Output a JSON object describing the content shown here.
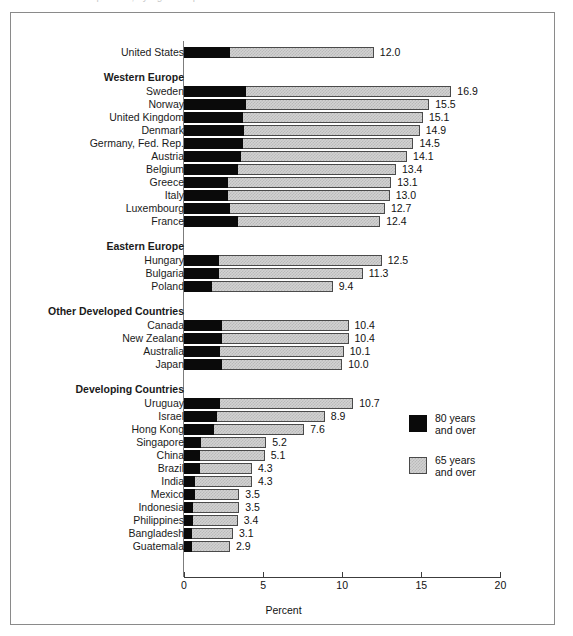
{
  "scan": {
    "top_ghost_text": "Percent of Population, by Age Group"
  },
  "chart_data": {
    "type": "bar",
    "orientation": "horizontal",
    "stacked": true,
    "title": "",
    "xlabel": "Percent",
    "ylabel": "",
    "xlim": [
      0,
      20
    ],
    "xticks": [
      0,
      5,
      10,
      15,
      20
    ],
    "xtick_labels": [
      "0",
      "5",
      "10",
      "15",
      "20"
    ],
    "grid": false,
    "legend_position": "right-inside",
    "series": [
      {
        "name": "80 years and over",
        "key": "v80",
        "color": "#0a0a0a"
      },
      {
        "name": "65 years and over",
        "key": "v65",
        "color": "#d2d2d2"
      }
    ],
    "legend": [
      {
        "line1": "80 years",
        "line2": "and over",
        "swatch": "dark"
      },
      {
        "line1": "65 years",
        "line2": "and over",
        "swatch": "light"
      }
    ],
    "rows": [
      {
        "type": "bar",
        "label": "United States",
        "v65": 12.0,
        "v80": 2.9,
        "value_label": "12.0"
      },
      {
        "type": "spacer"
      },
      {
        "type": "group",
        "label": "Western Europe"
      },
      {
        "type": "bar",
        "label": "Sweden",
        "v65": 16.9,
        "v80": 3.9,
        "value_label": "16.9"
      },
      {
        "type": "bar",
        "label": "Norway",
        "v65": 15.5,
        "v80": 3.9,
        "value_label": "15.5"
      },
      {
        "type": "bar",
        "label": "United Kingdom",
        "v65": 15.1,
        "v80": 3.7,
        "value_label": "15.1"
      },
      {
        "type": "bar",
        "label": "Denmark",
        "v65": 14.9,
        "v80": 3.8,
        "value_label": "14.9"
      },
      {
        "type": "bar",
        "label": "Germany, Fed. Rep.",
        "v65": 14.5,
        "v80": 3.7,
        "value_label": "14.5"
      },
      {
        "type": "bar",
        "label": "Austria",
        "v65": 14.1,
        "v80": 3.6,
        "value_label": "14.1"
      },
      {
        "type": "bar",
        "label": "Belgium",
        "v65": 13.4,
        "v80": 3.4,
        "value_label": "13.4"
      },
      {
        "type": "bar",
        "label": "Greece",
        "v65": 13.1,
        "v80": 2.8,
        "value_label": "13.1"
      },
      {
        "type": "bar",
        "label": "Italy",
        "v65": 13.0,
        "v80": 2.8,
        "value_label": "13.0"
      },
      {
        "type": "bar",
        "label": "Luxembourg",
        "v65": 12.7,
        "v80": 2.9,
        "value_label": "12.7"
      },
      {
        "type": "bar",
        "label": "France",
        "v65": 12.4,
        "v80": 3.4,
        "value_label": "12.4"
      },
      {
        "type": "spacer"
      },
      {
        "type": "group",
        "label": "Eastern Europe"
      },
      {
        "type": "bar",
        "label": "Hungary",
        "v65": 12.5,
        "v80": 2.2,
        "value_label": "12.5"
      },
      {
        "type": "bar",
        "label": "Bulgaria",
        "v65": 11.3,
        "v80": 2.2,
        "value_label": "11.3"
      },
      {
        "type": "bar",
        "label": "Poland",
        "v65": 9.4,
        "v80": 1.8,
        "value_label": "9.4"
      },
      {
        "type": "spacer"
      },
      {
        "type": "group",
        "label": "Other Developed Countries"
      },
      {
        "type": "bar",
        "label": "Canada",
        "v65": 10.4,
        "v80": 2.4,
        "value_label": "10.4"
      },
      {
        "type": "bar",
        "label": "New Zealand",
        "v65": 10.4,
        "v80": 2.4,
        "value_label": "10.4"
      },
      {
        "type": "bar",
        "label": "Australia",
        "v65": 10.1,
        "v80": 2.3,
        "value_label": "10.1"
      },
      {
        "type": "bar",
        "label": "Japan",
        "v65": 10.0,
        "v80": 2.4,
        "value_label": "10.0"
      },
      {
        "type": "spacer"
      },
      {
        "type": "group",
        "label": "Developing Countries"
      },
      {
        "type": "bar",
        "label": "Uruguay",
        "v65": 10.7,
        "v80": 2.3,
        "value_label": "10.7"
      },
      {
        "type": "bar",
        "label": "Israel",
        "v65": 8.9,
        "v80": 2.1,
        "value_label": "8.9"
      },
      {
        "type": "bar",
        "label": "Hong Kong",
        "v65": 7.6,
        "v80": 1.9,
        "value_label": "7.6"
      },
      {
        "type": "bar",
        "label": "Singapore",
        "v65": 5.2,
        "v80": 1.1,
        "value_label": "5.2"
      },
      {
        "type": "bar",
        "label": "China",
        "v65": 5.1,
        "v80": 1.0,
        "value_label": "5.1"
      },
      {
        "type": "bar",
        "label": "Brazil",
        "v65": 4.3,
        "v80": 1.0,
        "value_label": "4.3"
      },
      {
        "type": "bar",
        "label": "India",
        "v65": 4.3,
        "v80": 0.7,
        "value_label": "4.3"
      },
      {
        "type": "bar",
        "label": "Mexico",
        "v65": 3.5,
        "v80": 0.7,
        "value_label": "3.5"
      },
      {
        "type": "bar",
        "label": "Indonesia",
        "v65": 3.5,
        "v80": 0.6,
        "value_label": "3.5"
      },
      {
        "type": "bar",
        "label": "Philippines",
        "v65": 3.4,
        "v80": 0.6,
        "value_label": "3.4"
      },
      {
        "type": "bar",
        "label": "Bangladesh",
        "v65": 3.1,
        "v80": 0.5,
        "value_label": "3.1"
      },
      {
        "type": "bar",
        "label": "Guatemala",
        "v65": 2.9,
        "v80": 0.5,
        "value_label": "2.9"
      }
    ]
  }
}
